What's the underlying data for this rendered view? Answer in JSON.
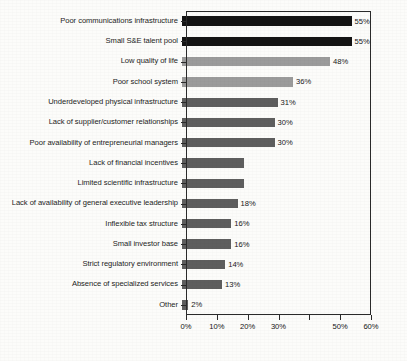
{
  "chart_data": {
    "type": "bar",
    "orientation": "horizontal",
    "title": "",
    "subtitle": "",
    "xlabel": "",
    "ylabel": "",
    "xlim": [
      0,
      60
    ],
    "grid": false,
    "legend": null,
    "value_suffix": "%",
    "axis": {
      "ticks": [
        0,
        10,
        20,
        30,
        40,
        50,
        60
      ],
      "tick_labels": [
        "0%",
        "10%",
        "20%",
        "30%",
        "",
        "50%",
        "60%"
      ],
      "note_missing_tick_label": "40"
    },
    "colors": {
      "black": "#141414",
      "light_gray": "#9b9b9b",
      "dark_gray": "#5e5e5e"
    },
    "categories": [
      "Poor communications infrastructure",
      "Small S&E talent pool",
      "Low quality of life",
      "Poor school system",
      "Underdeveloped physical infrastructure",
      "Lack of supplier/customer relationships",
      "Poor availability of entrepreneurial managers",
      "Lack of financial incentives",
      "Limited scientific infrastructure",
      "Lack of availability of general executive leadership",
      "Inflexible tax structure",
      "Small investor base",
      "Strict regulatory environment",
      "Absence of specialized services",
      "Other"
    ],
    "values": [
      55,
      55,
      48,
      36,
      31,
      30,
      30,
      20,
      20,
      18,
      16,
      16,
      14,
      13,
      2
    ],
    "data_labels": [
      "55%",
      "55%",
      "48%",
      "36%",
      "31%",
      "30%",
      "30%",
      "",
      "",
      "18%",
      "16%",
      "16%",
      "14%",
      "13%",
      "2%"
    ],
    "bar_colors": [
      "black",
      "black",
      "light_gray",
      "light_gray",
      "dark_gray",
      "dark_gray",
      "dark_gray",
      "dark_gray",
      "dark_gray",
      "dark_gray",
      "dark_gray",
      "dark_gray",
      "dark_gray",
      "dark_gray",
      "dark_gray"
    ]
  }
}
